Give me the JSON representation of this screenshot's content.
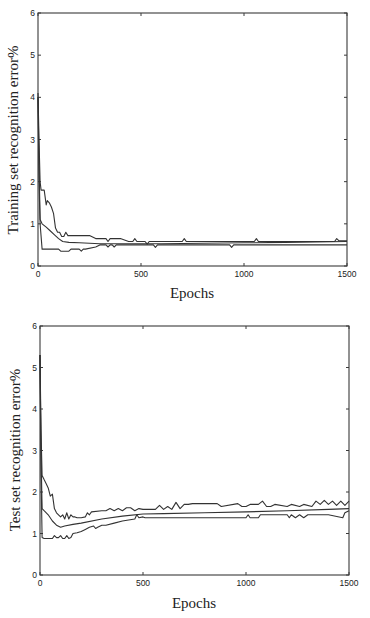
{
  "chart_data": [
    {
      "type": "line",
      "title": "",
      "xlabel": "Epochs",
      "ylabel": "Training set recognition error%",
      "xlim": [
        0,
        1500
      ],
      "ylim": [
        0,
        6
      ],
      "xticks": [
        0,
        500,
        1000,
        1500
      ],
      "yticks": [
        0,
        1,
        2,
        3,
        4,
        5,
        6
      ],
      "grid": false,
      "legend": null,
      "frame": {
        "left": 38,
        "right": 347,
        "top": 13,
        "bottom": 266
      },
      "series": [
        {
          "name": "upper",
          "x": [
            0,
            5,
            10,
            15,
            20,
            30,
            40,
            45,
            55,
            65,
            75,
            85,
            95,
            105,
            115,
            125,
            135,
            145,
            155,
            165,
            250,
            280,
            330,
            340,
            350,
            360,
            400,
            440,
            460,
            470,
            480,
            520,
            530,
            540,
            700,
            710,
            720,
            1050,
            1060,
            1070,
            1440,
            1450,
            1460,
            1500
          ],
          "y": [
            4.1,
            3.0,
            2.0,
            1.8,
            1.8,
            1.8,
            1.45,
            1.55,
            1.5,
            1.4,
            1.25,
            0.9,
            0.8,
            0.8,
            0.7,
            0.7,
            0.8,
            0.72,
            0.72,
            0.72,
            0.72,
            0.65,
            0.65,
            0.58,
            0.65,
            0.65,
            0.65,
            0.58,
            0.58,
            0.65,
            0.58,
            0.58,
            0.52,
            0.58,
            0.58,
            0.65,
            0.58,
            0.58,
            0.65,
            0.58,
            0.58,
            0.65,
            0.6,
            0.6
          ]
        },
        {
          "name": "mean",
          "x": [
            0,
            5,
            10,
            20,
            40,
            60,
            80,
            100,
            120,
            150,
            200,
            300,
            400,
            600,
            800,
            1000,
            1200,
            1500
          ],
          "y": [
            4.0,
            2.5,
            1.1,
            1.0,
            0.92,
            0.83,
            0.74,
            0.65,
            0.58,
            0.56,
            0.55,
            0.53,
            0.53,
            0.53,
            0.54,
            0.55,
            0.56,
            0.58
          ]
        },
        {
          "name": "lower",
          "x": [
            0,
            5,
            10,
            20,
            30,
            40,
            100,
            110,
            130,
            150,
            160,
            200,
            210,
            220,
            230,
            280,
            300,
            330,
            340,
            350,
            360,
            370,
            380,
            400,
            560,
            570,
            580,
            930,
            940,
            950,
            1500
          ],
          "y": [
            4.0,
            2.0,
            1.0,
            0.4,
            0.4,
            0.4,
            0.4,
            0.35,
            0.35,
            0.35,
            0.4,
            0.4,
            0.35,
            0.4,
            0.4,
            0.45,
            0.5,
            0.5,
            0.45,
            0.5,
            0.5,
            0.45,
            0.5,
            0.5,
            0.5,
            0.44,
            0.5,
            0.5,
            0.44,
            0.5,
            0.5
          ]
        }
      ]
    },
    {
      "type": "line",
      "title": "",
      "xlabel": "Epochs",
      "ylabel": "Test set recognition error%",
      "xlim": [
        0,
        1500
      ],
      "ylim": [
        0,
        6
      ],
      "xticks": [
        0,
        500,
        1000,
        1500
      ],
      "yticks": [
        0,
        1,
        2,
        3,
        4,
        5,
        6
      ],
      "grid": false,
      "legend": null,
      "frame": {
        "left": 40,
        "right": 349,
        "top": 326,
        "bottom": 575
      },
      "series": [
        {
          "name": "upper",
          "x": [
            0,
            5,
            10,
            20,
            30,
            40,
            50,
            60,
            70,
            80,
            90,
            100,
            110,
            120,
            130,
            140,
            150,
            160,
            170,
            180,
            200,
            220,
            230,
            240,
            250,
            300,
            320,
            340,
            360,
            380,
            400,
            420,
            440,
            460,
            480,
            500,
            560,
            580,
            600,
            620,
            640,
            660,
            680,
            700,
            720,
            740,
            860,
            880,
            960,
            980,
            1000,
            1020,
            1060,
            1080,
            1100,
            1120,
            1140,
            1200,
            1220,
            1260,
            1280,
            1320,
            1340,
            1360,
            1380,
            1400,
            1420,
            1440,
            1460,
            1480,
            1500
          ],
          "y": [
            5.3,
            3.5,
            2.4,
            2.3,
            2.2,
            2.1,
            1.9,
            1.95,
            1.6,
            1.5,
            1.45,
            1.4,
            1.45,
            1.35,
            1.5,
            1.35,
            1.45,
            1.4,
            1.4,
            1.38,
            1.38,
            1.4,
            1.5,
            1.45,
            1.52,
            1.55,
            1.55,
            1.6,
            1.55,
            1.6,
            1.55,
            1.62,
            1.62,
            1.55,
            1.6,
            1.58,
            1.58,
            1.68,
            1.58,
            1.65,
            1.58,
            1.75,
            1.6,
            1.7,
            1.7,
            1.72,
            1.72,
            1.65,
            1.72,
            1.65,
            1.65,
            1.7,
            1.7,
            1.78,
            1.65,
            1.65,
            1.7,
            1.65,
            1.7,
            1.65,
            1.7,
            1.65,
            1.78,
            1.7,
            1.8,
            1.7,
            1.78,
            1.68,
            1.78,
            1.68,
            1.78
          ]
        },
        {
          "name": "mean",
          "x": [
            0,
            5,
            10,
            20,
            40,
            60,
            80,
            100,
            120,
            160,
            200,
            300,
            400,
            500,
            600,
            800,
            1000,
            1200,
            1400,
            1500
          ],
          "y": [
            5.3,
            3.0,
            1.6,
            1.55,
            1.45,
            1.3,
            1.2,
            1.15,
            1.18,
            1.22,
            1.25,
            1.35,
            1.42,
            1.47,
            1.48,
            1.5,
            1.52,
            1.55,
            1.58,
            1.6
          ]
        },
        {
          "name": "lower",
          "x": [
            0,
            5,
            10,
            20,
            40,
            60,
            70,
            80,
            90,
            100,
            110,
            120,
            130,
            140,
            150,
            160,
            180,
            200,
            220,
            240,
            260,
            270,
            280,
            300,
            320,
            360,
            400,
            460,
            470,
            480,
            500,
            510,
            1000,
            1010,
            1020,
            1060,
            1070,
            1080,
            1200,
            1210,
            1220,
            1240,
            1260,
            1280,
            1300,
            1400,
            1470,
            1480,
            1500
          ],
          "y": [
            5.3,
            2.5,
            0.9,
            0.88,
            0.88,
            0.88,
            0.95,
            0.9,
            0.9,
            0.95,
            0.88,
            0.88,
            0.95,
            0.88,
            0.9,
            1.0,
            1.02,
            1.05,
            1.1,
            1.15,
            1.18,
            1.12,
            1.15,
            1.2,
            1.2,
            1.25,
            1.3,
            1.35,
            1.45,
            1.38,
            1.4,
            1.38,
            1.38,
            1.45,
            1.38,
            1.38,
            1.45,
            1.45,
            1.45,
            1.38,
            1.45,
            1.38,
            1.45,
            1.38,
            1.45,
            1.45,
            1.38,
            1.5,
            1.55
          ]
        }
      ]
    }
  ],
  "charts": [
    {
      "ylabel": "Training set recognition error%",
      "xlabel": "Epochs",
      "xtick_labels": [
        "0",
        "500",
        "1000",
        "1500"
      ],
      "ytick_labels": [
        "0",
        "1",
        "2",
        "3",
        "4",
        "5",
        "6"
      ]
    },
    {
      "ylabel": "Test set recognition error%",
      "xlabel": "Epochs",
      "xtick_labels": [
        "0",
        "500",
        "1000",
        "1500"
      ],
      "ytick_labels": [
        "0",
        "1",
        "2",
        "3",
        "4",
        "5",
        "6"
      ]
    }
  ]
}
